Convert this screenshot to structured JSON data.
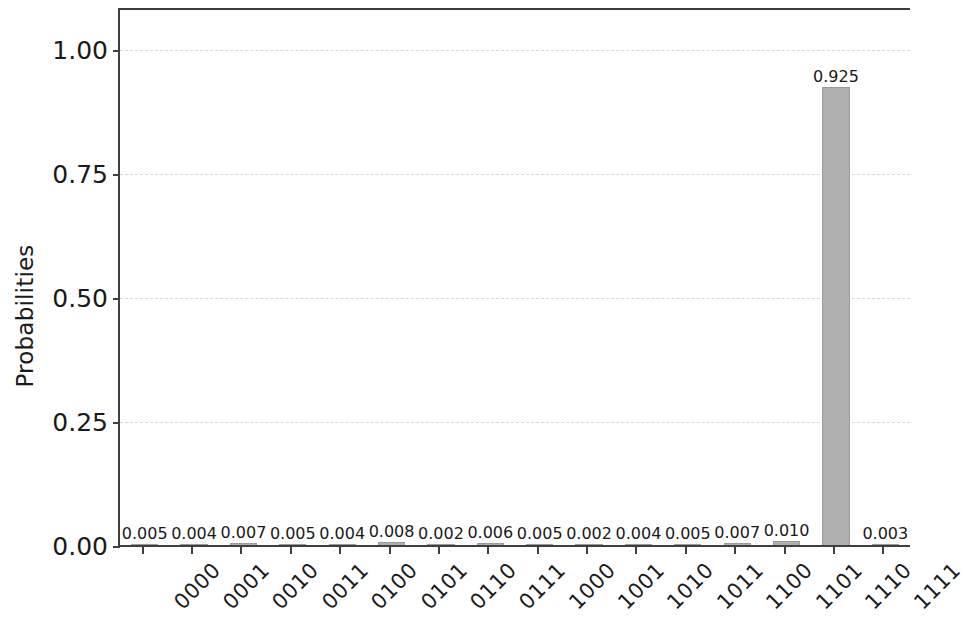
{
  "chart_data": {
    "type": "bar",
    "title": "",
    "xlabel": "",
    "ylabel": "Probabilities",
    "ylim": [
      0.0,
      1.08
    ],
    "yticks": [
      "0.00",
      "0.25",
      "0.50",
      "0.75",
      "1.00"
    ],
    "ytick_values": [
      0.0,
      0.25,
      0.5,
      0.75,
      1.0
    ],
    "grid": true,
    "grid_axis": "y",
    "grid_style": "dashed",
    "legend": null,
    "bar_color": "#b0b0b0",
    "bar_edge_color": "#9a9a9a",
    "categories": [
      "0000",
      "0001",
      "0010",
      "0011",
      "0100",
      "0101",
      "0110",
      "0111",
      "1000",
      "1001",
      "1010",
      "1011",
      "1100",
      "1101",
      "1110",
      "1111"
    ],
    "values": [
      0.005,
      0.004,
      0.007,
      0.005,
      0.004,
      0.008,
      0.002,
      0.006,
      0.005,
      0.002,
      0.004,
      0.005,
      0.007,
      0.01,
      0.925,
      0.003
    ],
    "value_labels": [
      "0.005",
      "0.004",
      "0.007",
      "0.005",
      "0.004",
      "0.008",
      "0.002",
      "0.006",
      "0.005",
      "0.002",
      "0.004",
      "0.005",
      "0.007",
      "0.010",
      "0.925",
      "0.003"
    ]
  }
}
